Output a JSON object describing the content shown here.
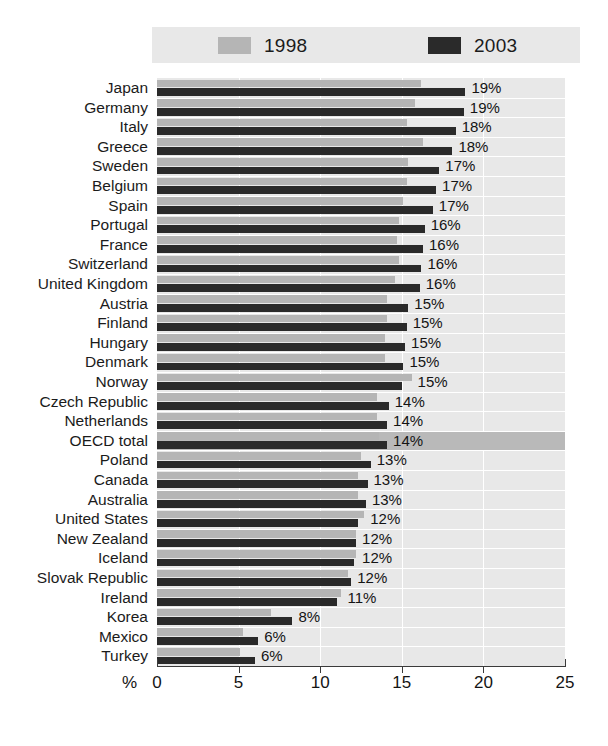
{
  "chart_data": {
    "type": "bar",
    "orientation": "horizontal",
    "title": "",
    "xlabel": "%",
    "ylabel": "",
    "xlim": [
      0,
      25
    ],
    "xticks": [
      0,
      5,
      10,
      15,
      20,
      25
    ],
    "xtick_labels": [
      "0",
      "5",
      "10",
      "15",
      "20",
      "25"
    ],
    "grid": true,
    "legend_position": "top",
    "legend": [
      "1998",
      "2003"
    ],
    "series": [
      {
        "name": "1998",
        "color": "#b5b5b5"
      },
      {
        "name": "2003",
        "color": "#2a2a2a"
      }
    ],
    "categories": [
      "Japan",
      "Germany",
      "Italy",
      "Greece",
      "Sweden",
      "Belgium",
      "Spain",
      "Portugal",
      "France",
      "Switzerland",
      "United Kingdom",
      "Austria",
      "Finland",
      "Hungary",
      "Denmark",
      "Norway",
      "Czech Republic",
      "Netherlands",
      "OECD total",
      "Poland",
      "Canada",
      "Australia",
      "United States",
      "New Zealand",
      "Iceland",
      "Slovak Republic",
      "Ireland",
      "Korea",
      "Mexico",
      "Turkey"
    ],
    "values_1998": [
      16.2,
      15.8,
      15.3,
      16.3,
      15.4,
      15.3,
      15.1,
      14.8,
      14.7,
      14.8,
      14.6,
      14.1,
      14.1,
      14.0,
      14.0,
      15.6,
      13.5,
      13.5,
      13.6,
      12.5,
      12.3,
      12.3,
      12.7,
      12.2,
      12.2,
      11.7,
      11.3,
      7.0,
      5.3,
      5.1
    ],
    "values_2003": [
      18.9,
      18.8,
      18.3,
      18.1,
      17.3,
      17.1,
      16.9,
      16.4,
      16.3,
      16.2,
      16.1,
      15.4,
      15.3,
      15.2,
      15.1,
      15.0,
      14.2,
      14.1,
      14.1,
      13.1,
      12.9,
      12.8,
      12.3,
      12.2,
      12.1,
      11.9,
      11.0,
      8.3,
      6.2,
      6.0
    ],
    "value_labels": [
      "19%",
      "19%",
      "18%",
      "18%",
      "17%",
      "17%",
      "17%",
      "16%",
      "16%",
      "16%",
      "16%",
      "15%",
      "15%",
      "15%",
      "15%",
      "15%",
      "14%",
      "14%",
      "14%",
      "13%",
      "13%",
      "13%",
      "12%",
      "12%",
      "12%",
      "12%",
      "11%",
      "8%",
      "6%",
      "6%"
    ],
    "highlight_row": "OECD total"
  },
  "legend": {
    "item_1998": "1998",
    "item_2003": "2003"
  },
  "axis": {
    "percent_sign": "%",
    "ticks": [
      "0",
      "5",
      "10",
      "15",
      "20",
      "25"
    ]
  },
  "colors": {
    "series_1998": "#b5b5b5",
    "series_2003": "#2a2a2a",
    "plot_background": "#e8e8e8",
    "highlight_band": "#b9b9b9",
    "gridline": "#ffffff",
    "axis": "#3a3a3a",
    "text": "#141414"
  }
}
